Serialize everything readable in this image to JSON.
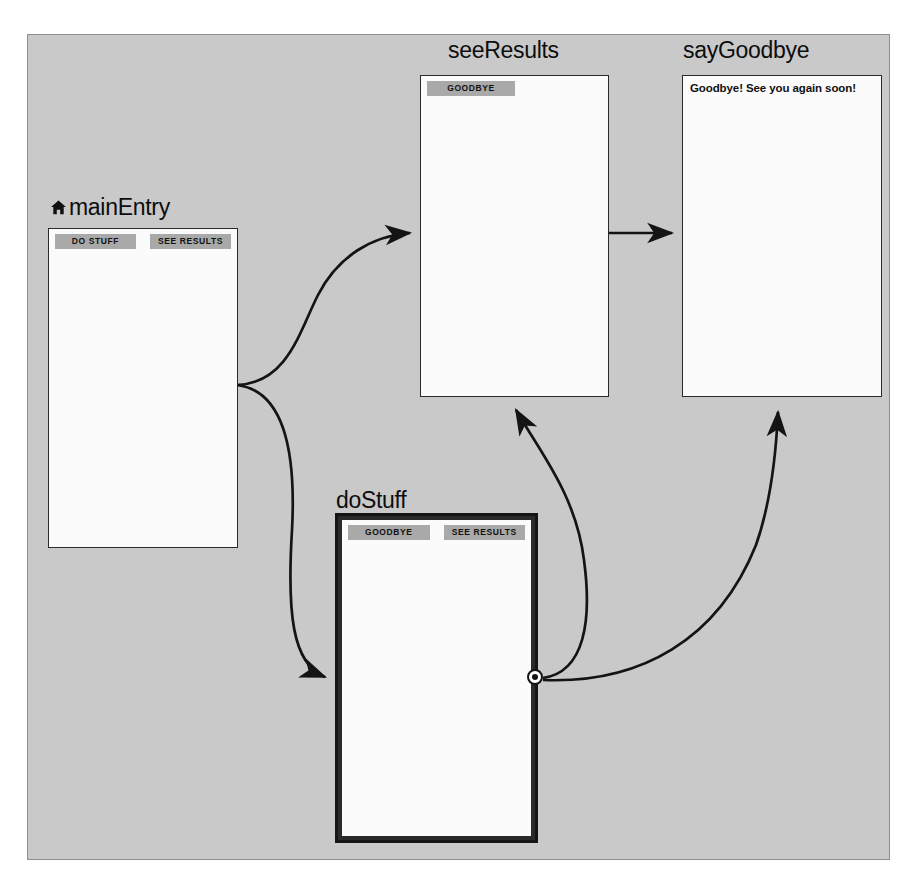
{
  "canvas": {
    "background_color": "#c9c9c9",
    "border_color": "#8f8f8f"
  },
  "screens": [
    {
      "id": "mainEntry",
      "label": "mainEntry",
      "icon": "home-icon",
      "is_entry": true,
      "selected": false,
      "buttons": [
        "DO STUFF",
        "SEE RESULTS"
      ],
      "body_text": ""
    },
    {
      "id": "seeResults",
      "label": "seeResults",
      "icon": "",
      "is_entry": false,
      "selected": false,
      "buttons": [
        "GOODBYE"
      ],
      "body_text": ""
    },
    {
      "id": "sayGoodbye",
      "label": "sayGoodbye",
      "icon": "",
      "is_entry": false,
      "selected": false,
      "buttons": [],
      "body_text": "Goodbye! See you again soon!"
    },
    {
      "id": "doStuff",
      "label": "doStuff",
      "icon": "",
      "is_entry": false,
      "selected": true,
      "buttons": [
        "GOODBYE",
        "SEE RESULTS"
      ],
      "body_text": ""
    }
  ],
  "connections": [
    {
      "from": "mainEntry",
      "to": "seeResults",
      "style": "curve",
      "arrow": true
    },
    {
      "from": "mainEntry",
      "to": "doStuff",
      "style": "curve",
      "arrow": true
    },
    {
      "from": "seeResults",
      "to": "sayGoodbye",
      "style": "straight",
      "arrow": true
    },
    {
      "from": "doStuff",
      "to": "seeResults",
      "style": "curve",
      "arrow": true
    },
    {
      "from": "doStuff",
      "to": "sayGoodbye",
      "style": "curve",
      "arrow": true
    }
  ],
  "colors": {
    "button_fill": "#a9a9a9",
    "screen_fill": "#fbfbfb",
    "line": "#141414",
    "text": "#111111"
  }
}
